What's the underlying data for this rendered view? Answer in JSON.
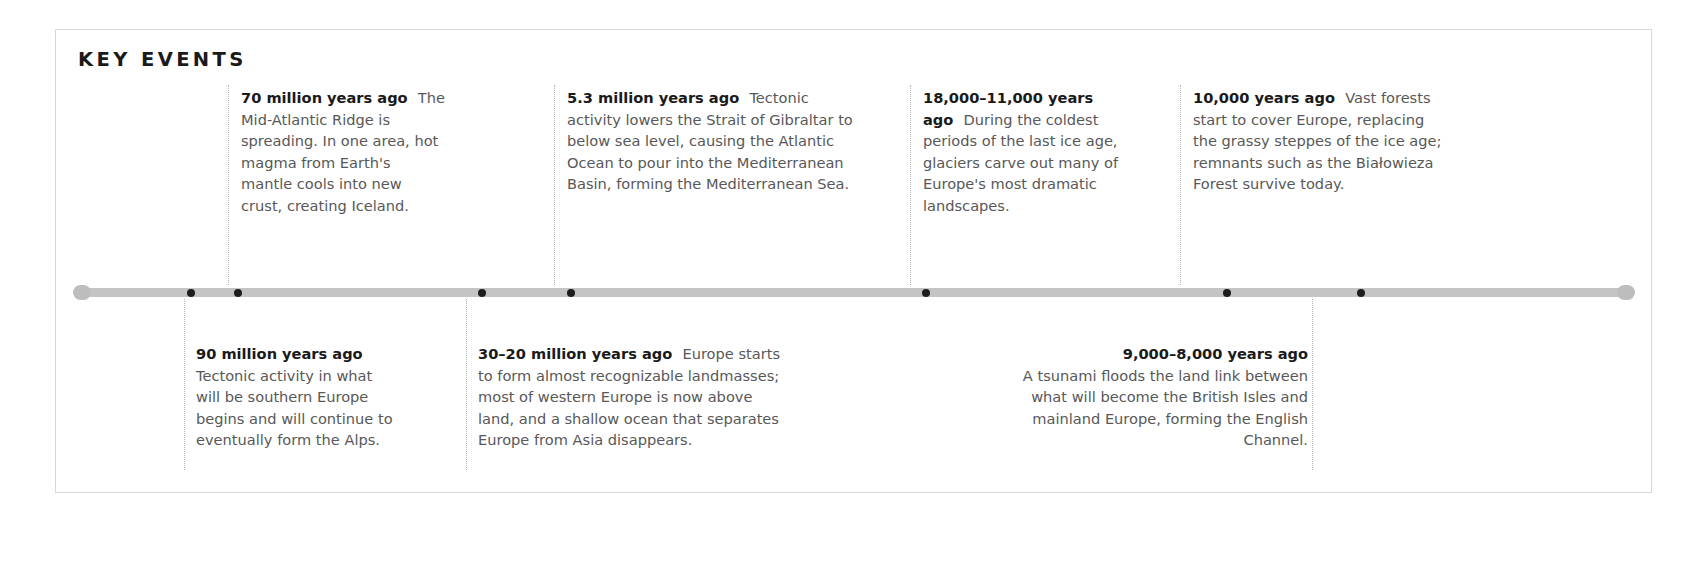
{
  "panel": {
    "title": "KEY EVENTS"
  },
  "timeline": {
    "markers": [
      {
        "name": "marker-90-million",
        "x_pct": 7.4
      },
      {
        "name": "marker-70-million",
        "x_pct": 10.4
      },
      {
        "name": "marker-30-20-million",
        "x_pct": 26.1
      },
      {
        "name": "marker-5-3-million",
        "x_pct": 31.8
      },
      {
        "name": "marker-18000-11000",
        "x_pct": 54.6
      },
      {
        "name": "marker-10000",
        "x_pct": 74.0
      },
      {
        "name": "marker-9000-8000",
        "x_pct": 82.6
      }
    ]
  },
  "events_above": [
    {
      "name": "event-70-million-years-ago",
      "date": "70 million years ago",
      "text": "The Mid-Atlantic Ridge is spreading. In one area, hot magma from Earth's mantle cools into new crust, creating Iceland.",
      "left": 185,
      "width": 205,
      "connector_x": 172,
      "align": "left",
      "stacked": false
    },
    {
      "name": "event-5-3-million-years-ago",
      "date": "5.3 million years ago",
      "text": "Tectonic activity lowers the Strait of Gibraltar to below sea level, causing the Atlantic Ocean to pour into the Mediterranean Basin, forming the Mediterranean Sea.",
      "left": 511,
      "width": 291,
      "connector_x": 498,
      "align": "left",
      "stacked": false
    },
    {
      "name": "event-18000-11000-years-ago",
      "date": "18,000–11,000 years ago",
      "text": "During the coldest periods of the last ice age, glaciers carve out many of Europe's most dramatic landscapes.",
      "left": 867,
      "width": 223,
      "connector_x": 854,
      "align": "left",
      "stacked": false
    },
    {
      "name": "event-10000-years-ago",
      "date": "10,000 years ago",
      "text": "Vast forests start to cover Europe, replacing the grassy steppes of the ice age; remnants such as the Białowieza Forest survive today.",
      "left": 1137,
      "width": 253,
      "connector_x": 1124,
      "align": "left",
      "stacked": false
    }
  ],
  "events_below": [
    {
      "name": "event-90-million-years-ago",
      "date": "90 million years ago",
      "text": "Tectonic activity in what will be southern Europe begins and will continue to eventually form the Alps.",
      "left": 140,
      "width": 200,
      "connector_x": 128,
      "align": "left",
      "stacked": true
    },
    {
      "name": "event-30-20-million-years-ago",
      "date": "30–20 million years ago",
      "text": "Europe starts to form almost recognizable landmasses; most of western Europe is now above land, and a shallow ocean that separates Europe from Asia disappears.",
      "left": 422,
      "width": 305,
      "connector_x": 410,
      "align": "left",
      "stacked": false
    },
    {
      "name": "event-9000-8000-years-ago",
      "date": "9,000–8,000 years ago",
      "text": "A tsunami floods the land link between what will become the British Isles and mainland Europe, forming the English Channel.",
      "left": 955,
      "width": 297,
      "connector_x": 1256,
      "align": "right",
      "stacked": true
    }
  ],
  "colors": {
    "axis_bar": "#c4c4c4",
    "marker_dot": "#1d1d1d",
    "connector": "#b5b5b5",
    "panel_border": "#d8d8d8",
    "body_text": "#585858",
    "heading_text": "#1a1a1a"
  }
}
